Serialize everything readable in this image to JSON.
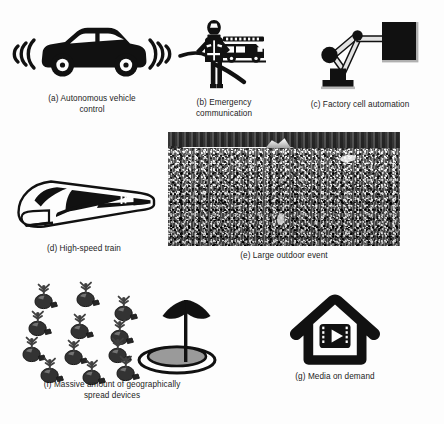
{
  "figure": {
    "background_color": "#fdfdfd",
    "ink_color": "#111111",
    "panels": [
      {
        "id": "a",
        "label": "(a)",
        "caption_line1": "(a) Autonomous vehicle",
        "caption_line2": "control",
        "icon": "car-with-signal-waves-icon"
      },
      {
        "id": "b",
        "label": "(b)",
        "caption_line1": "(b) Emergency",
        "caption_line2": "communication",
        "icon": "firefighter-with-fire-truck-icon"
      },
      {
        "id": "c",
        "label": "(c)",
        "caption_line1": "(c) Factory cell automation",
        "caption_line2": "",
        "icon": "robotic-arm-icon"
      },
      {
        "id": "d",
        "label": "(d)",
        "caption_line1": "(d) High-speed train",
        "caption_line2": "",
        "icon": "high-speed-train-icon"
      },
      {
        "id": "e",
        "label": "(e)",
        "caption_line1": "(e) Large outdoor event",
        "caption_line2": "",
        "icon": "crowd-photograph"
      },
      {
        "id": "f",
        "label": "(f)",
        "caption_line1": "(f) Massive amount of geographically",
        "caption_line2": "spread devices",
        "icon": "device-swarm-and-antenna-icon"
      },
      {
        "id": "g",
        "label": "(g)",
        "caption_line1": "(g) Media on demand",
        "caption_line2": "",
        "icon": "house-with-media-player-icon"
      }
    ]
  }
}
